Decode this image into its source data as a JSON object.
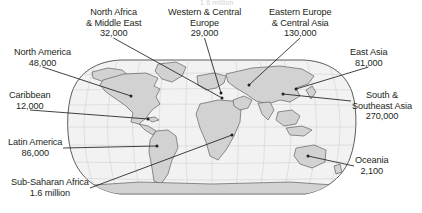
{
  "figure": {
    "type": "map-infographic",
    "projection": "robinson",
    "colors": {
      "land": "#d2d2d2",
      "land_stroke": "#555555",
      "ocean": "#f2f2f2",
      "graticule": "#bdbdbd",
      "leader_line": "#231f20",
      "text": "#231f20",
      "page": "#ffffff"
    },
    "top_artifact": "1.6 million"
  },
  "regions": [
    {
      "id": "north-africa-middle-east",
      "name": "North Africa\n& Middle East",
      "line1": "North Africa",
      "line2": "& Middle East",
      "value": "32,000",
      "align": "center",
      "label_x": 86,
      "label_y": 7,
      "target_x": 222,
      "target_y": 98
    },
    {
      "id": "western-central-europe",
      "name": "Western & Central Europe",
      "line1": "Western & Central",
      "line2": "Europe",
      "value": "29,000",
      "align": "center",
      "label_x": 168,
      "label_y": 7,
      "target_x": 221,
      "target_y": 93
    },
    {
      "id": "eastern-europe-central-asia",
      "name": "Eastern Europe & Central Asia",
      "line1": "Eastern Europe",
      "line2": "& Central Asia",
      "value": "130,000",
      "align": "center",
      "label_x": 269,
      "label_y": 7,
      "target_x": 249,
      "target_y": 85
    },
    {
      "id": "north-america",
      "name": "North America",
      "line1": "North America",
      "line2": "",
      "value": "48,000",
      "align": "center",
      "label_x": 14,
      "label_y": 47,
      "target_x": 131,
      "target_y": 96
    },
    {
      "id": "east-asia",
      "name": "East Asia",
      "line1": "East Asia",
      "line2": "",
      "value": "81,000",
      "align": "center",
      "label_x": 350,
      "label_y": 47,
      "target_x": 296,
      "target_y": 89
    },
    {
      "id": "caribbean",
      "name": "Caribbean",
      "line1": "Caribbean",
      "line2": "",
      "value": "12,000",
      "align": "center",
      "label_x": 9,
      "label_y": 90,
      "target_x": 148,
      "target_y": 119
    },
    {
      "id": "south-southeast-asia",
      "name": "South & Southeast Asia",
      "line1": "South &",
      "line2": "Southeast Asia",
      "value": "270,000",
      "align": "center",
      "label_x": 352,
      "label_y": 90,
      "target_x": 283,
      "target_y": 94
    },
    {
      "id": "latin-america",
      "name": "Latin America",
      "line1": "Latin America",
      "line2": "",
      "value": "86,000",
      "align": "center",
      "label_x": 8,
      "label_y": 137,
      "target_x": 157,
      "target_y": 146
    },
    {
      "id": "oceania",
      "name": "Oceania",
      "line1": "Oceania",
      "line2": "",
      "value": "2,100",
      "align": "center",
      "label_x": 355,
      "label_y": 155,
      "target_x": 308,
      "target_y": 156
    },
    {
      "id": "sub-saharan-africa",
      "name": "Sub-Saharan Africa",
      "line1": "Sub-Saharan Africa",
      "line2": "",
      "value": "1.6 million",
      "align": "center",
      "label_x": 11,
      "label_y": 177,
      "target_x": 232,
      "target_y": 135
    }
  ],
  "chart_data": {
    "type": "map",
    "title": "",
    "unit": "people",
    "categories": [
      "North Africa & Middle East",
      "Western & Central Europe",
      "Eastern Europe & Central Asia",
      "North America",
      "East Asia",
      "Caribbean",
      "South & Southeast Asia",
      "Latin America",
      "Oceania",
      "Sub-Saharan Africa"
    ],
    "values": [
      32000,
      29000,
      130000,
      48000,
      81000,
      12000,
      270000,
      86000,
      2100,
      1600000
    ],
    "value_labels": [
      "32,000",
      "29,000",
      "130,000",
      "48,000",
      "81,000",
      "12,000",
      "270,000",
      "86,000",
      "2,100",
      "1.6 million"
    ],
    "xlabel": "",
    "ylabel": "",
    "legend": [],
    "grid": false
  }
}
